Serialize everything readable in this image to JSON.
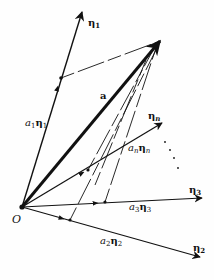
{
  "diagram": {
    "origin": {
      "label": "O",
      "x": 22,
      "y": 207
    },
    "vectors": [
      {
        "id": "eta1",
        "label": "η",
        "sub": "1",
        "tip": [
          82,
          12
        ]
      },
      {
        "id": "a",
        "label": "a",
        "tip": [
          160,
          41
        ]
      },
      {
        "id": "etan",
        "label": "η",
        "sub": "n",
        "tip": [
          162,
          123
        ]
      },
      {
        "id": "eta3",
        "label": "η",
        "sub": "3",
        "tip": [
          202,
          198
        ]
      },
      {
        "id": "eta2",
        "label": "η",
        "sub": "2",
        "tip": [
          200,
          257
        ]
      }
    ],
    "components": [
      {
        "id": "a1eta1",
        "coef": "a",
        "coef_sub": "1",
        "vec": "η",
        "vec_sub": "1",
        "point": [
          61,
          78
        ]
      },
      {
        "id": "aneta_n",
        "coef": "a",
        "coef_sub": "n",
        "vec": "η",
        "vec_sub": "n",
        "point": [
          88,
          170
        ]
      },
      {
        "id": "a3eta3",
        "coef": "a",
        "coef_sub": "3",
        "vec": "η",
        "vec_sub": "3",
        "point": [
          105,
          202
        ]
      },
      {
        "id": "a2eta2",
        "coef": "a",
        "coef_sub": "2",
        "vec": "η",
        "vec_sub": "2",
        "point": [
          70,
          220
        ]
      }
    ],
    "ellipsis": "⋮",
    "colors": {
      "ink": "#111111",
      "background": "#fefefe"
    }
  },
  "labels": {
    "origin": "O",
    "a": "a",
    "eta": "η",
    "a_coef": "a",
    "sub1": "1",
    "sub2": "2",
    "sub3": "3",
    "subn": "n"
  }
}
